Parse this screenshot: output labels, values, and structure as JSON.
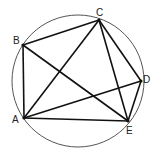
{
  "diagram": {
    "type": "cyclic-pentagon",
    "circle": {
      "cx": 78,
      "cy": 81,
      "r": 66,
      "color": "#555555"
    },
    "points": [
      {
        "id": "A",
        "label": "A",
        "x": 24,
        "y": 118,
        "lx": 12,
        "ly": 123
      },
      {
        "id": "B",
        "label": "B",
        "x": 23,
        "y": 45,
        "lx": 13,
        "ly": 44
      },
      {
        "id": "C",
        "label": "C",
        "x": 99,
        "y": 20,
        "lx": 96,
        "ly": 16
      },
      {
        "id": "D",
        "label": "D",
        "x": 141,
        "y": 81,
        "lx": 143,
        "ly": 83
      },
      {
        "id": "E",
        "label": "E",
        "x": 128,
        "y": 121,
        "lx": 126,
        "ly": 134
      }
    ],
    "segments": [
      [
        "A",
        "B"
      ],
      [
        "B",
        "C"
      ],
      [
        "A",
        "C"
      ],
      [
        "B",
        "E"
      ],
      [
        "C",
        "E"
      ],
      [
        "C",
        "D"
      ],
      [
        "D",
        "E"
      ],
      [
        "A",
        "D"
      ],
      [
        "A",
        "E"
      ]
    ],
    "line_color": "#111111"
  }
}
